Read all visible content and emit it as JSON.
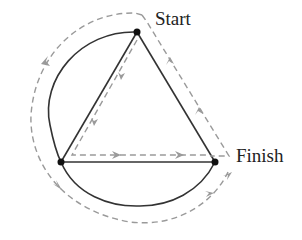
{
  "labels": {
    "start": "Start",
    "finish": "Finish"
  },
  "colors": {
    "solid": "#333333",
    "dashed": "#9a9a9a",
    "node": "#111111"
  },
  "nodes": [
    {
      "id": "start",
      "x": 137,
      "y": 32
    },
    {
      "id": "left",
      "x": 61,
      "y": 162
    },
    {
      "id": "finish",
      "x": 215,
      "y": 162
    }
  ]
}
